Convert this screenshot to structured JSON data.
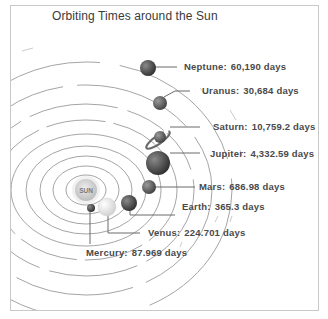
{
  "title": "Orbiting Times around the Sun",
  "sun": {
    "label": "SUN"
  },
  "planets": [
    {
      "name": "Neptune",
      "label": "Neptune:",
      "value": "60,190 days",
      "color": "#4a4a4a"
    },
    {
      "name": "Uranus",
      "label": "Uranus:",
      "value": "30,684 days",
      "color": "#555555"
    },
    {
      "name": "Saturn",
      "label": "Saturn:",
      "value": "10,759.2 days",
      "color": "#5a5a5a"
    },
    {
      "name": "Jupiter",
      "label": "Jupiter:",
      "value": "4,332.59 days",
      "color": "#4e4e4e"
    },
    {
      "name": "Mars",
      "label": "Mars:",
      "value": "686.98 days",
      "color": "#555555"
    },
    {
      "name": "Earth",
      "label": "Earth:",
      "value": "365.3 days",
      "color": "#3e3e3e"
    },
    {
      "name": "Venus",
      "label": "Venus:",
      "value": "224.701 days",
      "color": "#d8d8d8"
    },
    {
      "name": "Mercury",
      "label": "Mercury:",
      "value": "87.969 days",
      "color": "#3c3c3c"
    }
  ]
}
